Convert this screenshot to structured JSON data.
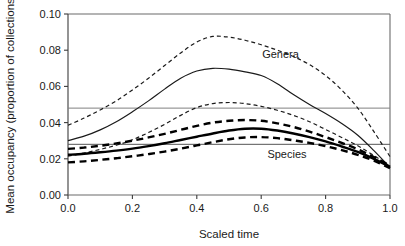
{
  "chart_data": {
    "type": "line",
    "title": "",
    "xlabel": "Scaled time",
    "ylabel": "Mean occupancy (proportion of collections)",
    "xlim": [
      0.0,
      1.0
    ],
    "ylim": [
      0.0,
      0.1
    ],
    "xticks": [
      "0.0",
      "0.2",
      "0.4",
      "0.6",
      "0.8",
      "1.0"
    ],
    "xtick_values": [
      0.0,
      0.2,
      0.4,
      0.6,
      0.8,
      1.0
    ],
    "yticks": [
      "0.00",
      "0.02",
      "0.04",
      "0.06",
      "0.08",
      "0.10"
    ],
    "ytick_values": [
      0.0,
      0.02,
      0.04,
      0.06,
      0.08,
      0.1
    ],
    "grid": false,
    "legend_position": "inline-annotations",
    "annotations": [
      {
        "text": "Genera",
        "x": 0.66,
        "y": 0.0755
      },
      {
        "text": "Species",
        "x": 0.68,
        "y": 0.0205
      }
    ],
    "reference_lines": [
      {
        "name": "genera-mean-reference",
        "y": 0.048,
        "color": "#808080",
        "style": "solid"
      },
      {
        "name": "species-mean-reference",
        "y": 0.028,
        "color": "#555555",
        "style": "solid"
      }
    ],
    "x": [
      0.0,
      0.05,
      0.1,
      0.15,
      0.2,
      0.25,
      0.3,
      0.35,
      0.4,
      0.45,
      0.5,
      0.55,
      0.6,
      0.65,
      0.7,
      0.75,
      0.8,
      0.85,
      0.9,
      0.95,
      1.0
    ],
    "series": [
      {
        "name": "Genera upper confidence limit",
        "style": "dashed-thin",
        "width": 1.2,
        "color": "#1a1a1a",
        "values": [
          0.0385,
          0.0425,
          0.047,
          0.052,
          0.058,
          0.0645,
          0.0715,
          0.0785,
          0.0845,
          0.0876,
          0.0872,
          0.0855,
          0.083,
          0.08,
          0.0765,
          0.072,
          0.066,
          0.058,
          0.048,
          0.035,
          0.0212
        ]
      },
      {
        "name": "Genera mean occupancy",
        "style": "solid-thin",
        "width": 1.2,
        "color": "#1a1a1a",
        "values": [
          0.03,
          0.0325,
          0.036,
          0.0405,
          0.046,
          0.052,
          0.0585,
          0.0645,
          0.0685,
          0.07,
          0.0695,
          0.068,
          0.066,
          0.0615,
          0.0555,
          0.05,
          0.045,
          0.0395,
          0.033,
          0.0245,
          0.0152
        ]
      },
      {
        "name": "Genera lower confidence limit",
        "style": "dashed-thin",
        "width": 1.2,
        "color": "#1a1a1a",
        "values": [
          0.0215,
          0.0232,
          0.0252,
          0.0275,
          0.0305,
          0.0345,
          0.039,
          0.044,
          0.0483,
          0.0505,
          0.0511,
          0.0505,
          0.049,
          0.0468,
          0.044,
          0.0405,
          0.0362,
          0.0318,
          0.0272,
          0.0218,
          0.0158
        ]
      },
      {
        "name": "Species upper confidence limit",
        "style": "dashed-thick",
        "width": 2.4,
        "color": "#000000",
        "values": [
          0.0255,
          0.0262,
          0.0272,
          0.0285,
          0.03,
          0.0318,
          0.0338,
          0.036,
          0.0382,
          0.04,
          0.041,
          0.0414,
          0.041,
          0.0396,
          0.0376,
          0.035,
          0.032,
          0.0288,
          0.0252,
          0.021,
          0.0162
        ]
      },
      {
        "name": "Species mean occupancy",
        "style": "solid-thick",
        "width": 2.4,
        "color": "#000000",
        "values": [
          0.0222,
          0.0228,
          0.0236,
          0.0245,
          0.0256,
          0.027,
          0.0286,
          0.0304,
          0.0322,
          0.034,
          0.0356,
          0.0366,
          0.0366,
          0.0356,
          0.034,
          0.032,
          0.0296,
          0.0268,
          0.0238,
          0.02,
          0.0155
        ]
      },
      {
        "name": "Species lower confidence limit",
        "style": "dashed-thick",
        "width": 2.4,
        "color": "#000000",
        "values": [
          0.018,
          0.0186,
          0.0194,
          0.0203,
          0.0214,
          0.0226,
          0.024,
          0.0256,
          0.0274,
          0.0292,
          0.0308,
          0.0318,
          0.032,
          0.0314,
          0.0302,
          0.0288,
          0.027,
          0.0248,
          0.0222,
          0.019,
          0.0148
        ]
      }
    ]
  },
  "axis": {
    "x_title": "Scaled time",
    "y_title": "Mean occupancy (proportion of collections)"
  }
}
